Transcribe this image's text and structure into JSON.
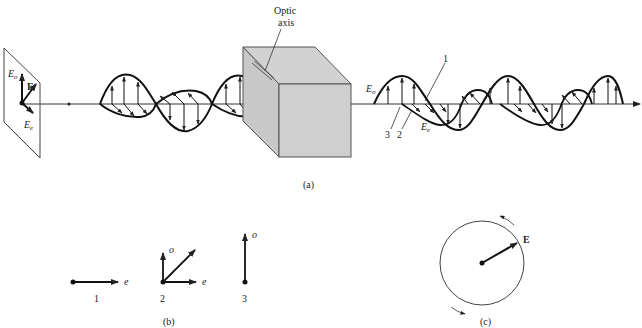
{
  "figure": {
    "panel_a": {
      "caption": "(a)",
      "input_plane": {
        "labels": {
          "Eo": "E",
          "Eo_sub": "o",
          "E": "E",
          "Ee": "E",
          "Ee_sub": "e"
        }
      },
      "crystal": {
        "label_line1": "Optic",
        "label_line2": "axis",
        "face_color": "#cfcfcf",
        "edge_color": "#555555"
      },
      "output_wave": {
        "labels": {
          "Eo": "E",
          "Eo_sub": "o",
          "Ee": "E",
          "Ee_sub": "e",
          "n1": "1",
          "n2": "2",
          "n3": "3"
        }
      }
    },
    "panel_b": {
      "caption": "(b)",
      "states": [
        {
          "number": "1",
          "axis_labels": [
            "e"
          ]
        },
        {
          "number": "2",
          "axis_labels": [
            "o",
            "e"
          ]
        },
        {
          "number": "3",
          "axis_labels": [
            "o"
          ]
        }
      ]
    },
    "panel_c": {
      "caption": "(c)",
      "vector_label": "E"
    }
  }
}
